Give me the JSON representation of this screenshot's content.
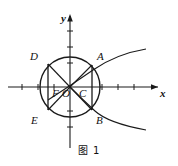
{
  "figure": {
    "caption": "图 1",
    "axes": {
      "x_label": "x",
      "y_label": "y"
    },
    "points": [
      {
        "id": "A",
        "label": "A",
        "x": 97,
        "y": 61
      },
      {
        "id": "B",
        "label": "B",
        "x": 97,
        "y": 119
      },
      {
        "id": "C",
        "label": "C",
        "x": 84,
        "y": 92
      },
      {
        "id": "D",
        "label": "D",
        "x": 35,
        "y": 56
      },
      {
        "id": "E",
        "label": "E",
        "x": 36,
        "y": 119
      },
      {
        "id": "F",
        "label": "F",
        "x": 59,
        "y": 92
      },
      {
        "id": "O",
        "label": "O",
        "x": 71,
        "y": 92
      }
    ],
    "circle": {
      "cx": 70,
      "cy": 87,
      "r": 30
    },
    "origin": {
      "cx": 70,
      "cy": 87
    },
    "x_axis_ticks": 7,
    "y_axis_ticks": 5,
    "colors": {
      "stroke": "#1a1a1a",
      "background": "#ffffff"
    }
  }
}
